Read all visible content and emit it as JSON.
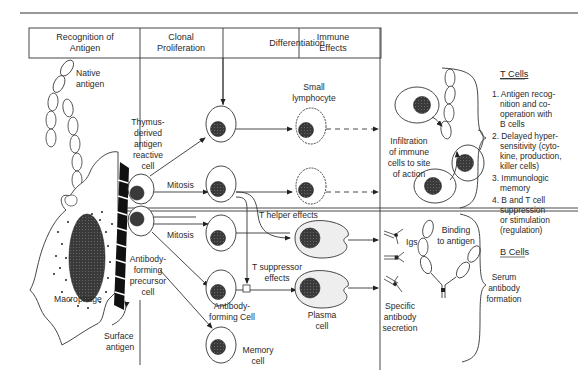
{
  "figure": {
    "domain_note": "Immune response diagram: T cells and B cells",
    "columns": [
      {
        "label_line1": "Recognition of",
        "label_line2": "Antigen"
      },
      {
        "label_line1": "Clonal",
        "label_line2": "Proliferation"
      },
      {
        "label_line1": "Differentiation",
        "label_line2": ""
      },
      {
        "label_line1": "Immune",
        "label_line2": "Effects"
      }
    ],
    "labels": {
      "native_antigen": [
        "Native",
        "antigen"
      ],
      "thymus_cell": [
        "Thymus-",
        "derived",
        "antigen",
        "reactive",
        "cell"
      ],
      "mitosis_top": "Mitosis",
      "mitosis_bottom": "Mitosis",
      "antibody_precursor": [
        "Antibody-",
        "forming",
        "precursor",
        "cell"
      ],
      "macrophage": "Macrophage",
      "surface_antigen": [
        "Surface",
        "antigen"
      ],
      "small_lymphocyte": [
        "Small",
        "lymphocyte"
      ],
      "t_helper": "T helper effects",
      "t_suppressor": [
        "T suppressor",
        "effects"
      ],
      "antibody_forming_cell": [
        "Antibody-",
        "forming Cell"
      ],
      "plasma_cell": [
        "Plasma",
        "cell"
      ],
      "memory_cell": [
        "Memory",
        "cell"
      ],
      "infiltration": [
        "Infiltration",
        "of immune",
        "cells to site",
        "of action"
      ],
      "igs": "Igs",
      "binding": [
        "Binding",
        "to antigen"
      ],
      "specific_secretion": [
        "Specific",
        "antibody",
        "secretion"
      ]
    },
    "t_cells": {
      "title": "T Cells",
      "items": [
        [
          "1. Antigen recog-",
          "nition and co-",
          "operation with",
          "B cells"
        ],
        [
          "2. Delayed hyper-",
          "sensitivity (cyto-",
          "kine, production,",
          "killer cells)"
        ],
        [
          "3. Immunologic",
          "memory"
        ],
        [
          "4. B and T cell",
          "suppression",
          "or stimulation",
          "(regulation)"
        ]
      ]
    },
    "b_cells": {
      "title": "B Cells",
      "summary": [
        "Serum",
        "antibody",
        "formation"
      ]
    },
    "colors": {
      "ink": "#2a2a2a",
      "nucleus": "#3a3a3a",
      "plasma_fill": "#eeeeee",
      "background": "#ffffff"
    }
  }
}
